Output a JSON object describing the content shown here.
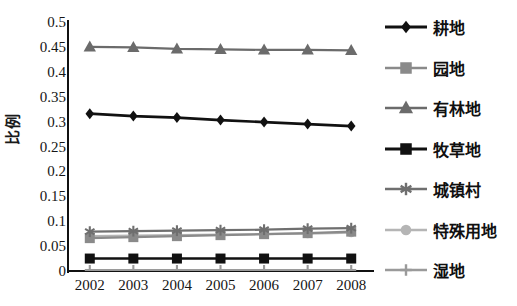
{
  "chart_data": {
    "type": "line",
    "title": "",
    "xlabel": "",
    "ylabel": "比例",
    "categories": [
      "2002",
      "2003",
      "2004",
      "2005",
      "2006",
      "2007",
      "2008"
    ],
    "ylim": [
      0,
      0.5
    ],
    "yticks": [
      "0",
      "0.05",
      "0.1",
      "0.15",
      "0.2",
      "0.25",
      "0.3",
      "0.35",
      "0.4",
      "0.45",
      "0.5"
    ],
    "ytick_values": [
      0,
      0.05,
      0.1,
      0.15,
      0.2,
      0.25,
      0.3,
      0.35,
      0.4,
      0.45,
      0.5
    ],
    "grid": false,
    "legend_position": "right",
    "series": [
      {
        "name": "耕地",
        "marker": "diamond",
        "color": "#111111",
        "values": [
          0.316,
          0.311,
          0.308,
          0.303,
          0.299,
          0.295,
          0.291
        ]
      },
      {
        "name": "园地",
        "marker": "square",
        "color": "#8a8a8a",
        "values": [
          0.066,
          0.068,
          0.07,
          0.072,
          0.074,
          0.076,
          0.079
        ]
      },
      {
        "name": "有林地",
        "marker": "triangle",
        "color": "#6b6b6b",
        "values": [
          0.45,
          0.449,
          0.446,
          0.445,
          0.444,
          0.444,
          0.443
        ]
      },
      {
        "name": "牧草地",
        "marker": "square",
        "color": "#111111",
        "values": [
          0.025,
          0.025,
          0.025,
          0.025,
          0.025,
          0.025,
          0.025
        ]
      },
      {
        "name": "城镇村",
        "marker": "asterisk",
        "color": "#6f6f6f",
        "values": [
          0.079,
          0.08,
          0.081,
          0.082,
          0.083,
          0.085,
          0.086
        ]
      },
      {
        "name": "特殊用地",
        "marker": "circle",
        "color": "#b5b5b5",
        "values": [
          0.07,
          0.071,
          0.072,
          0.073,
          0.074,
          0.075,
          0.077
        ]
      },
      {
        "name": "湿地",
        "marker": "plus",
        "color": "#9a9a9a",
        "values": [
          0.002,
          0.002,
          0.002,
          0.002,
          0.002,
          0.002,
          0.002
        ]
      }
    ]
  },
  "axis": {
    "y_title": "比例"
  }
}
